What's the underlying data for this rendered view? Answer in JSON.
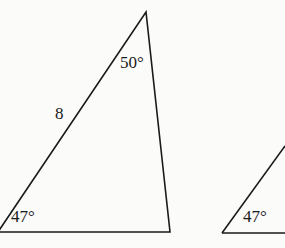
{
  "diagram": {
    "triangle_left": {
      "side_label": "8",
      "top_angle": "50°",
      "bottom_left_angle": "47°"
    },
    "triangle_right": {
      "bottom_left_angle": "47°"
    }
  }
}
